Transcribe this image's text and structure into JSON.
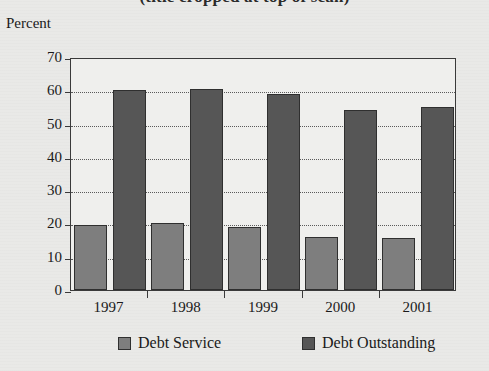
{
  "title": "(title cropped at top of scan)",
  "axis_unit_label": "Percent",
  "legend": {
    "items": [
      {
        "label": "Debt Service",
        "color": "#7e7e7e"
      },
      {
        "label": "Debt Outstanding",
        "color": "#565656"
      }
    ]
  },
  "chart_data": {
    "type": "bar",
    "title": "",
    "xlabel": "",
    "ylabel": "Percent",
    "ylim": [
      0,
      70
    ],
    "yticks": [
      0,
      10,
      20,
      30,
      40,
      50,
      60,
      70
    ],
    "ytick_labels": [
      "0",
      "10",
      "20",
      "30",
      "40",
      "50",
      "60",
      "70"
    ],
    "grid": true,
    "legend_position": "bottom",
    "categories": [
      "1997",
      "1998",
      "1999",
      "2000",
      "2001"
    ],
    "series": [
      {
        "name": "Debt Service",
        "color": "#7e7e7e",
        "values": [
          19.5,
          20.0,
          19.0,
          16.0,
          15.5
        ]
      },
      {
        "name": "Debt Outstanding",
        "color": "#565656",
        "values": [
          60.0,
          60.5,
          59.0,
          54.0,
          55.0
        ]
      }
    ]
  }
}
